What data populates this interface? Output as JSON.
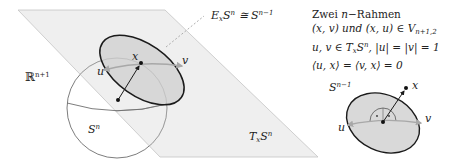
{
  "figure": {
    "colors": {
      "plane_fill": "#ededed",
      "plane_stroke": "#bdbdbd",
      "sphere_stroke": "#6e6e6e",
      "disk_fill": "#d6d6d6",
      "disk_stroke": "#1a1a1a",
      "vector_stroke": "#1a1a1a",
      "tangent_stroke": "#a8a8a8",
      "dashed_stroke": "#9a9a9a"
    },
    "labels": {
      "ambient_space": "ℝ",
      "ambient_space_sup": "n+1",
      "sphere": "S",
      "sphere_sup": "n",
      "tangent_plane": "T",
      "tangent_plane_sub": "x",
      "tangent_plane_S": "S",
      "tangent_plane_sup": "n",
      "equator_E": "E",
      "equator_sub": "x",
      "equator_S": "S",
      "equator_sup": "n",
      "equator_cong": " ≅ S",
      "equator_rhs_sup": "n−1",
      "point_x": "x",
      "vec_u": "u",
      "vec_v": "v"
    },
    "inset": {
      "sphere_label": "S",
      "sphere_label_sup": "n−1",
      "point_x": "x",
      "vec_u": "u",
      "vec_v": "v",
      "right_angle_marks": [
        "·",
        "·"
      ]
    },
    "text_block": {
      "lines": [
        "Zwei n−Rahmen",
        "(x, v) und (x, u) ∈ V",
        "u, v ∈ T",
        "⟨u, x⟩ = ⟨v, x⟩ = 0"
      ],
      "line1_word": "Zwei ",
      "line1_n": "n",
      "line1_rest": "−Rahmen",
      "line2_main": "(x, v) und (x, u) ∈ V",
      "line2_sub": "n+1,2",
      "line3_a": "u, v ∈ T",
      "line3_sub": "x",
      "line3_b": "S",
      "line3_sup": "n",
      "line3_c": ", |u| = |v| = 1",
      "line4": "⟨u, x⟩ = ⟨v, x⟩ = 0"
    }
  }
}
